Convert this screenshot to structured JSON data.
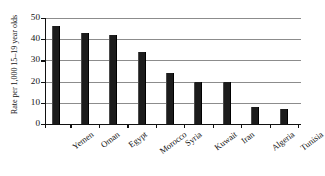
{
  "chart_data": {
    "type": "bar",
    "title": "",
    "subtitle": "",
    "xlabel": "",
    "ylabel": "Rate per 1,000 15–19 year olds",
    "categories": [
      "Yemen",
      "Oman",
      "Egypt",
      "Morocco",
      "Syria",
      "Kuwait",
      "Iran",
      "Algeria",
      "Tunisia"
    ],
    "values": [
      46,
      43,
      42,
      34,
      24,
      20,
      20,
      8,
      7
    ],
    "ylim": [
      0,
      50
    ],
    "yticks": [
      0,
      10,
      20,
      30,
      40,
      50
    ],
    "ytick_labels": [
      "0",
      "10",
      "20",
      "30",
      "40",
      "50"
    ],
    "grid": true,
    "grid_axis": "y",
    "legend": false,
    "legend_position": "none",
    "bar_color": "#1c1c1c",
    "gridline_color": "#8c8c8c",
    "axis_color": "#111111",
    "background_color": "#ffffff",
    "xlabel_rotation": -37
  }
}
